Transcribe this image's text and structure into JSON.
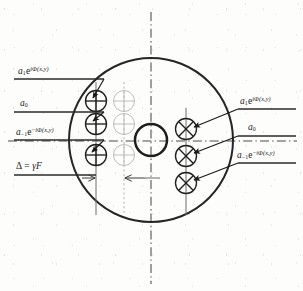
{
  "figure": {
    "kind": "optical-diffraction-aperture-diagram"
  },
  "labels": {
    "left": [
      {
        "id": "left-order-plus1",
        "amplitude": "a",
        "order": "1",
        "exp_base": "e",
        "exp_sign": "",
        "exp_body": "iΦ(x,y)",
        "plain": "a₁e^{iΦ(x,y)}"
      },
      {
        "id": "left-order-zero",
        "amplitude": "a",
        "order": "0",
        "exp_base": "",
        "exp_sign": "",
        "exp_body": "",
        "plain": "a₀"
      },
      {
        "id": "left-order-minus1",
        "amplitude": "a",
        "order": "−1",
        "exp_base": "e",
        "exp_sign": "−",
        "exp_body": "iΦ(x,y)",
        "plain": "a₋₁e^{−iΦ(x,y)}"
      }
    ],
    "right": [
      {
        "id": "right-order-plus1",
        "amplitude": "a",
        "order": "1",
        "exp_base": "e",
        "exp_sign": "",
        "exp_body": "iΦ(x,y)",
        "plain": "a₁e^{iΦ(x,y)}"
      },
      {
        "id": "right-order-zero",
        "amplitude": "a",
        "order": "0",
        "exp_base": "",
        "exp_sign": "",
        "exp_body": "",
        "plain": "a₀"
      },
      {
        "id": "right-order-minus1",
        "amplitude": "a",
        "order": "−1",
        "exp_base": "e",
        "exp_sign": "−",
        "exp_body": "iΦ(x,y)",
        "plain": "a₋₁e^{−iΦ(x,y)}"
      }
    ],
    "dimension": {
      "id": "aperture-shift-dimension",
      "symbol": "Δ",
      "equals": "=",
      "value_gamma": "γ",
      "value_F": "F",
      "plain": "Δ = γF"
    }
  },
  "colors": {
    "ink": "#1a1a1a",
    "ink_soft": "#2b2b2b",
    "ghost": "#b8b8b8",
    "guide": "#5a5a5a",
    "paper": "#fdfdfc"
  },
  "geometry": {
    "outer_circle": {
      "cx": 151,
      "cy": 140,
      "r": 82
    },
    "inner_circle": {
      "cx": 151,
      "cy": 140,
      "r": 16
    },
    "left_spots": [
      {
        "cx": 96,
        "cy": 101
      },
      {
        "cx": 96,
        "cy": 124
      },
      {
        "cx": 96,
        "cy": 155
      }
    ],
    "ghost_spots": [
      {
        "cx": 124,
        "cy": 101
      },
      {
        "cx": 124,
        "cy": 124
      },
      {
        "cx": 124,
        "cy": 155
      }
    ],
    "right_spots": [
      {
        "cx": 186,
        "cy": 129
      },
      {
        "cx": 186,
        "cy": 156
      },
      {
        "cx": 186,
        "cy": 183
      }
    ],
    "spot_radius": 10.5,
    "center_axis_y": 141,
    "center_axis_x": 151
  }
}
